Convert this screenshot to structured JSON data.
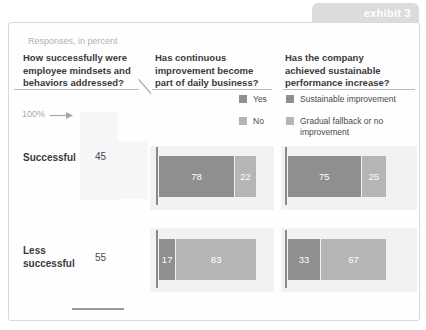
{
  "exhibit": {
    "label": "exhibit 3"
  },
  "subtitle": "Responses, in percent",
  "questions": {
    "q1": "How successfully were\nemployee mindsets and\nbehaviors addressed?",
    "q2": "Has continuous\nimprovement become\npart of daily business?",
    "q3": "Has the company\nachieved sustainable\nperformance increase?"
  },
  "legend": {
    "q2": [
      {
        "label": "Yes",
        "color": "#8f8f8f"
      },
      {
        "label": "No",
        "color": "#b5b5b5"
      }
    ],
    "q3": [
      {
        "label": "Sustainable improvement",
        "color": "#8f8f8f"
      },
      {
        "label": "Gradual fallback  or no\nimprovement",
        "color": "#b5b5b5"
      }
    ]
  },
  "axis": {
    "scale_label": "100%"
  },
  "rows": [
    {
      "label": "Successful",
      "value": 45
    },
    {
      "label": "Less\nsuccessful",
      "value": 55
    }
  ],
  "bars": {
    "q2r1": {
      "a": 78,
      "b": 22
    },
    "q2r2": {
      "a": 17,
      "b": 83
    },
    "q3r1": {
      "a": 75,
      "b": 25
    },
    "q3r2": {
      "a": 33,
      "b": 67
    }
  },
  "colors": {
    "segment_dark": "#8f8f8f",
    "segment_light": "#b5b5b5",
    "tab_background": "#dcdcdc",
    "tab_text": "#ffffff",
    "card_border": "#d9d9d9",
    "header_text": "#3a3a3a",
    "muted_text": "#b2b2b2"
  },
  "chart_data": {
    "type": "bar",
    "title": "exhibit 3",
    "subtitle": "Responses, in percent",
    "orientation": "horizontal",
    "stacked": true,
    "unit": "percent",
    "categories": [
      "Successful",
      "Less successful"
    ],
    "panels": [
      {
        "question": "How successfully were employee mindsets and behaviors addressed?",
        "values": [
          45,
          55
        ],
        "note": "single values shown next to row labels, scale reference 100%"
      },
      {
        "question": "Has continuous improvement become part of daily business?",
        "series": [
          {
            "name": "Yes",
            "values": [
              78,
              17
            ],
            "color": "#8f8f8f"
          },
          {
            "name": "No",
            "values": [
              22,
              83
            ],
            "color": "#b5b5b5"
          }
        ],
        "xlim": [
          0,
          100
        ],
        "legend_position": "above-right"
      },
      {
        "question": "Has the company achieved sustainable performance increase?",
        "series": [
          {
            "name": "Sustainable improvement",
            "values": [
              75,
              33
            ],
            "color": "#8f8f8f"
          },
          {
            "name": "Gradual fallback or no improvement",
            "values": [
              25,
              67
            ],
            "color": "#b5b5b5"
          }
        ],
        "xlim": [
          0,
          100
        ],
        "legend_position": "above-right"
      }
    ],
    "grid": false
  }
}
